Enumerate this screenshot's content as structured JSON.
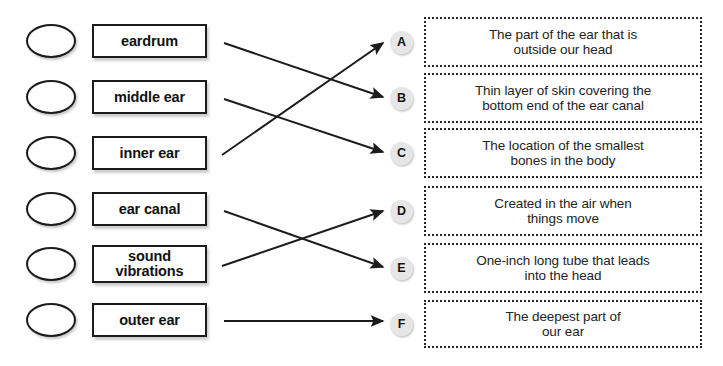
{
  "worksheet": {
    "type": "matching-exercise",
    "title": "",
    "ink_color": "#1c1c1c",
    "badge_color": "#e6e6e6"
  },
  "terms": [
    {
      "id": "term-eardrum",
      "label": "eardrum",
      "bubble": "answer-bubble",
      "top": 24,
      "height": 34
    },
    {
      "id": "term-middle-ear",
      "label": "middle ear",
      "bubble": "answer-bubble",
      "top": 80,
      "height": 34
    },
    {
      "id": "term-inner-ear",
      "label": "inner ear",
      "bubble": "answer-bubble",
      "top": 136,
      "height": 34
    },
    {
      "id": "term-ear-canal",
      "label": "ear canal",
      "bubble": "answer-bubble",
      "top": 192,
      "height": 34
    },
    {
      "id": "term-sound-vibrations",
      "label": "sound\nvibrations",
      "bubble": "answer-bubble",
      "top": 245,
      "height": 38
    },
    {
      "id": "term-outer-ear",
      "label": "outer ear",
      "bubble": "answer-bubble",
      "top": 303,
      "height": 34
    }
  ],
  "definitions": [
    {
      "id": "def-a",
      "letter": "A",
      "text": "The part of the ear that is\noutside our head",
      "top": 17,
      "height": 50
    },
    {
      "id": "def-b",
      "letter": "B",
      "text": "Thin layer of skin covering the\nbottom end of the ear canal",
      "top": 73,
      "height": 50
    },
    {
      "id": "def-c",
      "letter": "C",
      "text": "The location of the smallest\nbones in the body",
      "top": 128,
      "height": 50
    },
    {
      "id": "def-d",
      "letter": "D",
      "text": "Created in the air when\nthings move",
      "top": 186,
      "height": 50
    },
    {
      "id": "def-e",
      "letter": "E",
      "text": "One-inch long tube that leads\ninto the head",
      "top": 243,
      "height": 50
    },
    {
      "id": "def-f",
      "letter": "F",
      "text": "The deepest part of\nour ear",
      "top": 300,
      "height": 48
    }
  ],
  "connections": [
    {
      "id": "link-eardrum-to-b",
      "from": "term-eardrum",
      "to": "def-b",
      "x1": 224,
      "y1": 43,
      "x2": 383,
      "y2": 97
    },
    {
      "id": "link-middle-ear-to-c",
      "from": "term-middle-ear",
      "to": "def-c",
      "x1": 224,
      "y1": 99,
      "x2": 383,
      "y2": 152
    },
    {
      "id": "link-inner-ear-to-a",
      "from": "term-inner-ear",
      "to": "def-a",
      "x1": 222,
      "y1": 155,
      "x2": 383,
      "y2": 43
    },
    {
      "id": "link-ear-canal-to-e",
      "from": "term-ear-canal",
      "to": "def-e",
      "x1": 224,
      "y1": 211,
      "x2": 383,
      "y2": 267
    },
    {
      "id": "link-sound-vibrations-to-d",
      "from": "term-sound-vibrations",
      "to": "def-d",
      "x1": 222,
      "y1": 266,
      "x2": 383,
      "y2": 211
    },
    {
      "id": "link-outer-ear-to-f",
      "from": "term-outer-ear",
      "to": "def-f",
      "x1": 224,
      "y1": 321,
      "x2": 383,
      "y2": 321
    }
  ]
}
